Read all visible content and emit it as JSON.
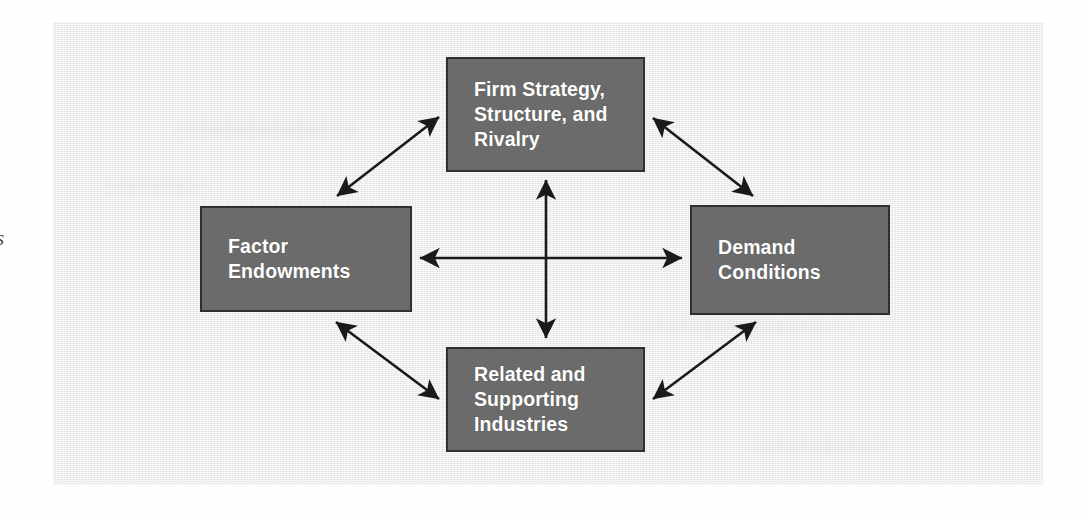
{
  "figure": {
    "name": "porters-diamond-model",
    "panel_background_color": "#e9e9e9",
    "box_fill_color": "#6b6b6b",
    "box_border_color": "#2f2f2f",
    "box_text_color": "#ffffff",
    "arrow_color": "#1a1a1a"
  },
  "margin": {
    "cropped_glyph": "s"
  },
  "nodes": {
    "firm_strategy": {
      "label": "Firm Strategy,\nStructure, and\nRivalry"
    },
    "factor_endowments": {
      "label": "Factor\nEndowments"
    },
    "demand_conditions": {
      "label": "Demand\nConditions"
    },
    "related_supporting": {
      "label": "Related and\nSupporting\nIndustries"
    }
  },
  "arrows": [
    {
      "name": "firm-strategy-to-factor-endowments",
      "type": "double-headed-diagonal"
    },
    {
      "name": "firm-strategy-to-demand-conditions",
      "type": "double-headed-diagonal"
    },
    {
      "name": "factor-endowments-to-related-supporting",
      "type": "double-headed-diagonal"
    },
    {
      "name": "demand-conditions-to-related-supporting",
      "type": "double-headed-diagonal"
    },
    {
      "name": "factor-endowments-to-demand-conditions",
      "type": "double-headed-horizontal"
    },
    {
      "name": "firm-strategy-to-related-supporting",
      "type": "double-headed-vertical"
    }
  ]
}
